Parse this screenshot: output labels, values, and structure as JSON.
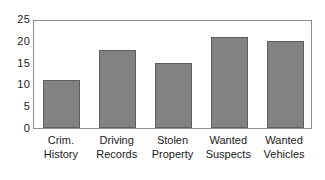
{
  "chart_data": {
    "type": "bar",
    "title": "",
    "subtitle": "",
    "xlabel": "",
    "ylabel": "",
    "categories": [
      "Crim. History",
      "Driving Records",
      "Stolen Property",
      "Wanted Suspects",
      "Wanted Vehicles"
    ],
    "category_lines": [
      [
        "Crim.",
        "History"
      ],
      [
        "Driving",
        "Records"
      ],
      [
        "Stolen",
        "Property"
      ],
      [
        "Wanted",
        "Suspects"
      ],
      [
        "Wanted",
        "Vehicles"
      ]
    ],
    "values": [
      11,
      18,
      15,
      20.8,
      20
    ],
    "ylim": [
      0,
      25
    ],
    "yticks": [
      0,
      5,
      10,
      15,
      20,
      25
    ],
    "ytick_labels": [
      "0",
      "5",
      "10",
      "15",
      "20",
      "25"
    ],
    "grid": false,
    "legend": null,
    "bar_color": "#828282",
    "bar_edge_color": "#5e5e5e",
    "frame_color": "#8d8d8d",
    "background": "#ffffff",
    "text_color": "#1a1a1a"
  }
}
